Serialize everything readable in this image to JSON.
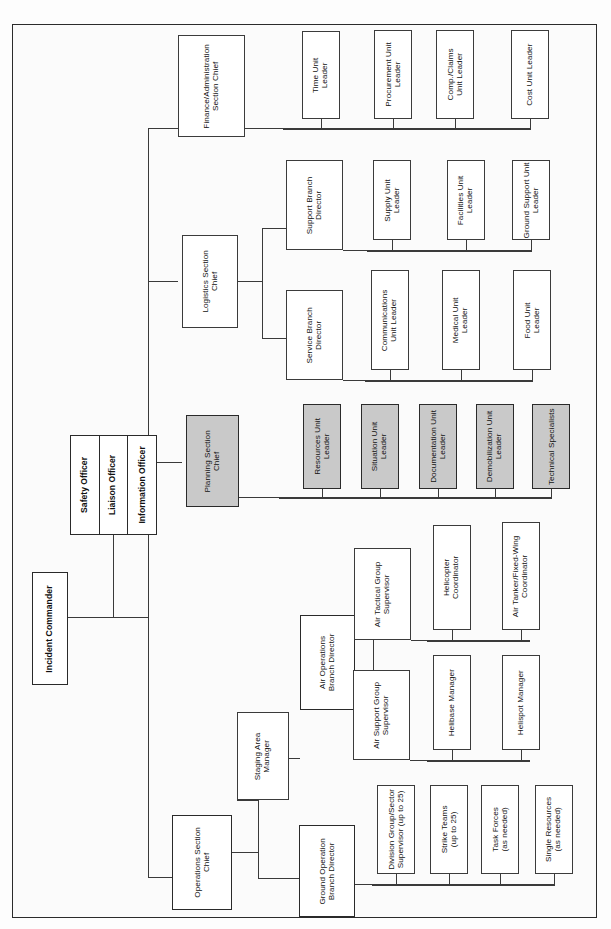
{
  "document": {
    "title": "Incident Command System Organizational Chart",
    "frame": {
      "border_color": "#2b2b2b",
      "background": "#fbfbfb"
    },
    "colors": {
      "box_fill": "#ffffff",
      "shaded_fill": "#c9c9c9",
      "line": "#3a3a3a",
      "text": "#111111"
    }
  },
  "command": {
    "incident_commander": "Incident Commander",
    "command_staff": [
      {
        "label": "Safety Officer"
      },
      {
        "label": "Liaison Officer"
      },
      {
        "label": "Information Officer"
      }
    ]
  },
  "sections": {
    "finance": {
      "chief": "Finance/Administration\nSection Chief",
      "units": [
        {
          "label": "Time Unit\nLeader"
        },
        {
          "label": "Procurement Unit\nLeader"
        },
        {
          "label": "Comp./Claims\nUnit Leader"
        },
        {
          "label": "Cost Unit Leader"
        }
      ]
    },
    "logistics": {
      "chief": "Logistics Section\nChief",
      "branches": [
        {
          "label": "Support Branch\nDirector",
          "units": [
            {
              "label": "Supply Unit\nLeader"
            },
            {
              "label": "Facilities Unit\nLeader"
            },
            {
              "label": "Ground Support Unit\nLeader"
            }
          ]
        },
        {
          "label": "Service Branch\nDirector",
          "units": [
            {
              "label": "Communications\nUnit Leader"
            },
            {
              "label": "Medical Unit\nLeader"
            },
            {
              "label": "Food Unit\nLeader"
            }
          ]
        }
      ]
    },
    "planning": {
      "chief": "Planning Section\nChief",
      "shaded": true,
      "units": [
        {
          "label": "Resources Unit\nLeader"
        },
        {
          "label": "Situation Unit\nLeader"
        },
        {
          "label": "Documentation Unit\nLeader"
        },
        {
          "label": "Demobilization Unit\nLeader"
        },
        {
          "label": "Technical Specialists"
        }
      ]
    },
    "operations": {
      "chief": "Operations Section\nChief",
      "staging": "Staging Area\nManager",
      "air_branch": {
        "label": "Air Operations\nBranch Director",
        "groups": [
          {
            "label": "Air Tactical Group\nSupervisor",
            "units": [
              {
                "label": "Helicopter\nCoordinator"
              },
              {
                "label": "Air Tanker/Fixed-Wing\nCoordinator"
              }
            ]
          },
          {
            "label": "Air Support Group\nSupervisor",
            "units": [
              {
                "label": "Helibase Manager"
              },
              {
                "label": "Helispot Manager"
              }
            ]
          }
        ]
      },
      "ground_branch": {
        "label": "Ground Operation\nBranch Director",
        "units": [
          {
            "label": "Division Group/Sector\nSupervisor (up to 25)"
          },
          {
            "label": "Strike Teams\n(up to 25)"
          },
          {
            "label": "Task Forces\n(as needed)"
          },
          {
            "label": "Single Resources\n(as needed)"
          }
        ]
      }
    }
  }
}
